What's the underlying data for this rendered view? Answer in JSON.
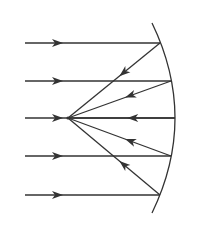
{
  "diagram": {
    "type": "concave-mirror-ray-diagram",
    "colors": {
      "line": "#333333",
      "background": "#ffffff"
    },
    "focal_point": {
      "x": 68,
      "y": 118
    },
    "mirror": {
      "top": [
        152,
        23
      ],
      "bottom": [
        152,
        213
      ],
      "control": [
        198,
        118
      ]
    },
    "incident_rays": [
      {
        "y": 43,
        "start_x": 25,
        "hit_x": 160,
        "arrow_x": 58
      },
      {
        "y": 81,
        "start_x": 25,
        "hit_x": 171,
        "arrow_x": 58
      },
      {
        "y": 118,
        "start_x": 25,
        "hit_x": 175,
        "arrow_x": 58
      },
      {
        "y": 156,
        "start_x": 25,
        "hit_x": 171,
        "arrow_x": 58
      },
      {
        "y": 195,
        "start_x": 25,
        "hit_x": 160,
        "arrow_x": 58
      }
    ]
  }
}
